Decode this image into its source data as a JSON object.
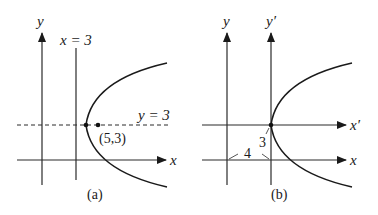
{
  "figure": {
    "panels": [
      {
        "id": "a",
        "caption": "(a)",
        "axes": {
          "x_label": "x",
          "y_label": "y"
        },
        "lines": [
          {
            "label": "x = 3",
            "kind": "vertical-directrix"
          },
          {
            "label": "y = 3",
            "kind": "dashed-horizontal"
          }
        ],
        "points": [
          {
            "label": "(5,3)",
            "kind": "focus"
          },
          {
            "label": "",
            "kind": "vertex"
          }
        ],
        "curve": "parabola opening right"
      },
      {
        "id": "b",
        "caption": "(b)",
        "axes": {
          "x_label": "x",
          "y_label": "y",
          "x_prime_label": "x′",
          "y_prime_label": "y′"
        },
        "dimensions": [
          {
            "label": "4",
            "kind": "horizontal-shift"
          },
          {
            "label": "3",
            "kind": "vertical-shift"
          }
        ],
        "curve": "parabola opening right, vertex at new origin"
      }
    ]
  }
}
